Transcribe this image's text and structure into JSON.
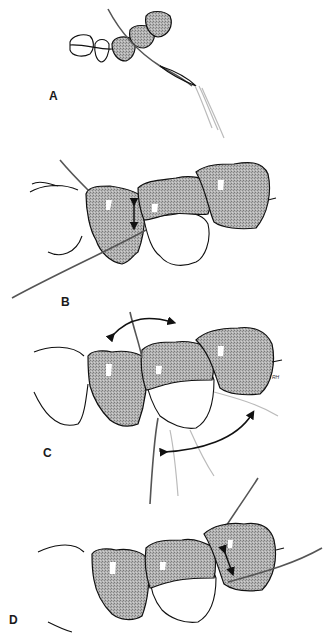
{
  "figure": {
    "shading_color": "#a8a8a8",
    "line_color": "#111111",
    "panels": [
      {
        "label": "A",
        "description": "Dental arch with floss wrapped around fingers, inserted between teeth"
      },
      {
        "label": "B",
        "description": "Floss moved up and down against proximal tooth surface (vertical arrow)"
      },
      {
        "label": "C",
        "description": "Floss wrapped in C-shape around tooth, curved arrows showing movement"
      },
      {
        "label": "D",
        "description": "Floss moved up and down on adjacent tooth surface (diagonal arrow)"
      }
    ],
    "artist_signature": "RH"
  }
}
